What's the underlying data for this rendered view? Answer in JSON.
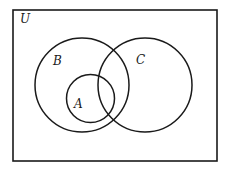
{
  "diagram": {
    "type": "venn",
    "universe": {
      "label": "U",
      "x": 13,
      "y": 10,
      "width": 204,
      "height": 151
    },
    "sets": [
      {
        "label": "B",
        "cx": 82,
        "cy": 85,
        "r": 47,
        "label_x": 57,
        "label_y": 65
      },
      {
        "label": "C",
        "cx": 145,
        "cy": 85,
        "r": 47,
        "label_x": 140,
        "label_y": 65
      },
      {
        "label": "A",
        "cx": 90.5,
        "cy": 98.5,
        "r": 24,
        "label_x": 78,
        "label_y": 108
      }
    ],
    "relations": "A is a subset of B; A overlaps C; B overlaps C",
    "stroke_color": "#1a1a1a",
    "background_color": "#ffffff"
  }
}
